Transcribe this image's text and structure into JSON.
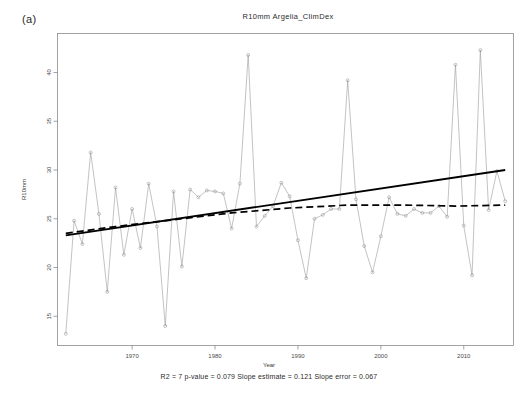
{
  "panel_label": "(a)",
  "x_axis_title": "Year",
  "stats_caption": "R2 = 7  p-value = 0.079  Slope estimate = 0.121  Slope error = 0.067",
  "stats": {
    "r2": "R2 = 7",
    "p_value": "p-value = 0.079",
    "slope_estimate": "Slope estimate = 0.121",
    "slope_error": "Slope error = 0.067"
  },
  "chart_data": {
    "type": "line",
    "title": "R10mm  Argelia_ClimDex",
    "xlabel": "Year",
    "ylabel": "R10mm",
    "xlim": [
      1961,
      2016
    ],
    "ylim": [
      12,
      44
    ],
    "grid": false,
    "legend": "none",
    "xticks": [
      1970,
      1980,
      1990,
      2000,
      2010
    ],
    "yticks": [
      15,
      20,
      25,
      30,
      35,
      40
    ],
    "x": [
      1962,
      1963,
      1964,
      1965,
      1966,
      1967,
      1968,
      1969,
      1970,
      1971,
      1972,
      1973,
      1974,
      1975,
      1976,
      1977,
      1978,
      1979,
      1980,
      1981,
      1982,
      1983,
      1984,
      1985,
      1986,
      1987,
      1988,
      1989,
      1990,
      1991,
      1992,
      1993,
      1994,
      1995,
      1996,
      1997,
      1998,
      1999,
      2000,
      2001,
      2002,
      2003,
      2004,
      2005,
      2006,
      2007,
      2008,
      2009,
      2010,
      2011,
      2012,
      2013,
      2014,
      2015
    ],
    "series": [
      {
        "name": "R10mm",
        "style": "observed",
        "values": [
          13.2,
          24.8,
          22.4,
          31.8,
          25.5,
          17.5,
          28.2,
          21.3,
          26.0,
          22.0,
          28.6,
          24.2,
          14.0,
          27.8,
          20.1,
          28.0,
          27.2,
          27.9,
          27.8,
          27.6,
          24.0,
          28.6,
          41.8,
          24.2,
          25.3,
          26.3,
          28.7,
          27.3,
          22.8,
          18.9,
          25.0,
          25.4,
          26.0,
          26.0,
          39.2,
          27.0,
          22.2,
          19.5,
          23.2,
          27.2,
          25.5,
          25.3,
          26.0,
          25.6,
          25.6,
          26.3,
          25.2,
          40.8,
          24.3,
          19.2,
          42.3,
          25.9,
          29.9,
          26.8
        ]
      },
      {
        "name": "Linear trend",
        "style": "solid",
        "x": [
          1962,
          2015
        ],
        "values": [
          23.3,
          30.0
        ]
      },
      {
        "name": "Smoothed trend",
        "style": "dashed",
        "x": [
          1962,
          1968,
          1975,
          1982,
          1989,
          1996,
          2003,
          2009,
          2015
        ],
        "values": [
          23.5,
          24.2,
          24.9,
          25.6,
          26.1,
          26.4,
          26.4,
          26.3,
          26.4
        ]
      }
    ]
  }
}
